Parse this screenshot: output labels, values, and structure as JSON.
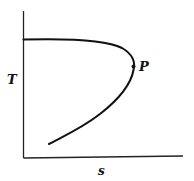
{
  "diagram": {
    "type": "T-s curve",
    "axes": {
      "y_label": "T",
      "x_label": "s"
    },
    "point": {
      "label": "P"
    },
    "colors": {
      "line": "#111111",
      "background": "#ffffff"
    }
  }
}
